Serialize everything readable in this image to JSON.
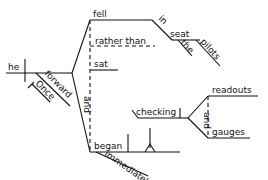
{
  "diagram": {
    "type": "sentence-diagram (Reed-Kellogg)",
    "subject": "he",
    "subject_modifiers": [
      "forward",
      "Once"
    ],
    "conjunction": "and",
    "predicates": {
      "fell": "fell",
      "rather_than": "rather than",
      "sat": "sat",
      "began": "began"
    },
    "prep_phrase": {
      "preposition": "in",
      "object": "seat",
      "object_modifiers": [
        "the",
        "pilots"
      ]
    },
    "adverb": "immediately",
    "gerund_phrase": {
      "gerund": "checking",
      "conjunction": "and",
      "objects": [
        "readouts",
        "gauges"
      ]
    }
  }
}
